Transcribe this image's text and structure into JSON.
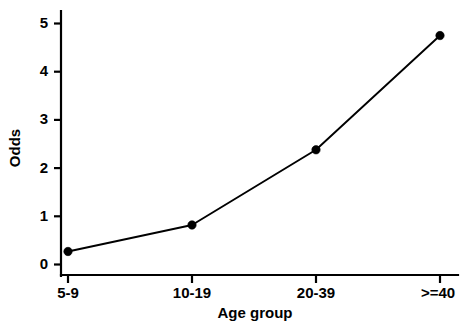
{
  "chart_data": {
    "type": "line",
    "title": "",
    "xlabel": "Age group",
    "ylabel": "Odds",
    "categories": [
      "5-9",
      "10-19",
      "20-39",
      ">=40"
    ],
    "values": [
      0.27,
      0.82,
      2.38,
      4.75
    ],
    "series": [
      {
        "name": "Odds",
        "values": [
          0.27,
          0.82,
          2.38,
          4.75
        ]
      }
    ],
    "ylim": [
      0,
      5.2
    ],
    "y_ticks": [
      0,
      1,
      2,
      3,
      4,
      5
    ],
    "y_tick_labels": [
      "0",
      "1",
      "2",
      "3",
      "4",
      "5"
    ],
    "x_tick_labels": [
      "5-9",
      "10-19",
      "20-39",
      ">=40"
    ],
    "grid": false,
    "legend": false,
    "legend_position": "none",
    "line_color": "#000000",
    "marker_color": "#000000",
    "marker_shape": "circle",
    "background_color": "#ffffff"
  },
  "axis": {
    "y_label": "Odds",
    "x_label": "Age group",
    "y_tick_0": "0",
    "y_tick_1": "1",
    "y_tick_2": "2",
    "y_tick_3": "3",
    "y_tick_4": "4",
    "y_tick_5": "5",
    "x_tick_0": "5-9",
    "x_tick_1": "10-19",
    "x_tick_2": "20-39",
    "x_tick_3": ">=40"
  }
}
